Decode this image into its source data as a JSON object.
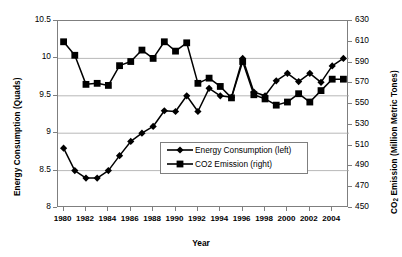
{
  "chart_data": {
    "type": "line",
    "title": "",
    "xlabel": "Year",
    "ylabel": "Energy Consumption (Quads)",
    "y2label": "CO2 Emission (Million Metric Tones)",
    "grid": true,
    "legend_position": "center",
    "x": [
      1980,
      1981,
      1982,
      1983,
      1984,
      1985,
      1986,
      1987,
      1988,
      1989,
      1990,
      1991,
      1992,
      1993,
      1994,
      1995,
      1996,
      1997,
      1998,
      1999,
      2000,
      2001,
      2002,
      2003,
      2004,
      2005
    ],
    "xlim": [
      1979.5,
      2005.5
    ],
    "xticks": [
      "1980",
      "1982",
      "1984",
      "1986",
      "1988",
      "1990",
      "1992",
      "1994",
      "1996",
      "1998",
      "2000",
      "2002",
      "2004"
    ],
    "ylim": [
      8,
      10.5
    ],
    "yticks": [
      "8",
      "8.5",
      "9",
      "9.5",
      "10",
      "10.5"
    ],
    "y2lim": [
      450,
      630
    ],
    "y2ticks": [
      "450",
      "470",
      "490",
      "510",
      "530",
      "550",
      "570",
      "590",
      "610",
      "630"
    ],
    "series": [
      {
        "name": "Energy Consumption (left)",
        "axis": "left",
        "marker": "diamond",
        "color": "#000000",
        "values": [
          8.8,
          8.5,
          8.4,
          8.4,
          8.5,
          8.7,
          8.89,
          9.0,
          9.09,
          9.3,
          9.29,
          9.5,
          9.29,
          9.6,
          9.5,
          9.48,
          10.0,
          9.55,
          9.5,
          9.7,
          9.8,
          9.69,
          9.8,
          9.68,
          9.9,
          10.0
        ]
      },
      {
        "name": "CO2 Emission (right)",
        "axis": "right",
        "marker": "square",
        "color": "#000000",
        "values": [
          610,
          597,
          569,
          570,
          568,
          587,
          591,
          602,
          594,
          610,
          601,
          609,
          570,
          575,
          567,
          556,
          591,
          559,
          555,
          549,
          552,
          560,
          552,
          563,
          574,
          574
        ]
      }
    ],
    "legend": [
      {
        "label": "Energy Consumption (left)",
        "marker": "diamond"
      },
      {
        "label": "CO2 Emission (right)",
        "marker": "square"
      }
    ]
  }
}
